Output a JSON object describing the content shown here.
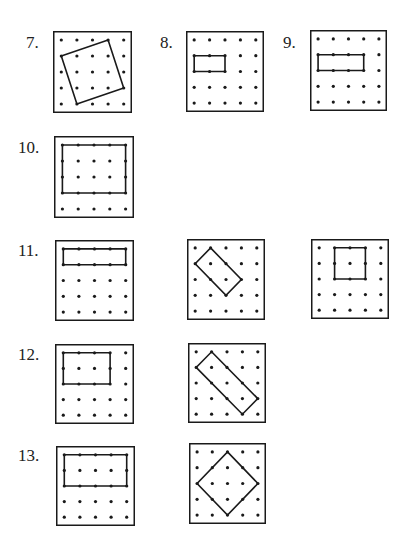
{
  "colors": {
    "ink": "#1a1a1a",
    "background": "#ffffff"
  },
  "grid": {
    "rows": 5,
    "cols": 5
  },
  "problems": [
    {
      "label": "7.",
      "label_pos": [
        26,
        34
      ]
    },
    {
      "label": "8.",
      "label_pos": [
        160,
        34
      ]
    },
    {
      "label": "9.",
      "label_pos": [
        283,
        34
      ]
    },
    {
      "label": "10.",
      "label_pos": [
        18,
        139
      ]
    },
    {
      "label": "11.",
      "label_pos": [
        18,
        242
      ]
    },
    {
      "label": "12.",
      "label_pos": [
        18,
        346
      ]
    },
    {
      "label": "13.",
      "label_pos": [
        18,
        447
      ]
    }
  ],
  "boards": [
    {
      "id": "7",
      "box": [
        53,
        31,
        79,
        82
      ],
      "shape": [
        [
          0,
          1
        ],
        [
          3,
          0
        ],
        [
          4,
          3
        ],
        [
          1,
          4
        ]
      ]
    },
    {
      "id": "8",
      "box": [
        186,
        31,
        78,
        81
      ],
      "shape": [
        [
          0,
          1
        ],
        [
          2,
          1
        ],
        [
          2,
          2
        ],
        [
          0,
          2
        ]
      ]
    },
    {
      "id": "9",
      "box": [
        310,
        30,
        77,
        81
      ],
      "shape": [
        [
          0,
          1
        ],
        [
          3,
          1
        ],
        [
          3,
          2
        ],
        [
          0,
          2
        ]
      ]
    },
    {
      "id": "10",
      "box": [
        54,
        136,
        80,
        82
      ],
      "shape": [
        [
          0,
          0
        ],
        [
          4,
          0
        ],
        [
          4,
          3
        ],
        [
          0,
          3
        ]
      ]
    },
    {
      "id": "11a",
      "box": [
        55,
        240,
        79,
        81
      ],
      "shape": [
        [
          0,
          0
        ],
        [
          4,
          0
        ],
        [
          4,
          1
        ],
        [
          0,
          1
        ]
      ]
    },
    {
      "id": "11b",
      "box": [
        187,
        239,
        78,
        81
      ],
      "shape": [
        [
          1,
          0
        ],
        [
          3,
          2
        ],
        [
          2,
          3
        ],
        [
          0,
          1
        ]
      ]
    },
    {
      "id": "11c",
      "box": [
        311,
        239,
        78,
        80
      ],
      "shape": [
        [
          1,
          0
        ],
        [
          3,
          0
        ],
        [
          3,
          2
        ],
        [
          1,
          2
        ]
      ]
    },
    {
      "id": "12a",
      "box": [
        55,
        344,
        79,
        80
      ],
      "shape": [
        [
          0,
          0
        ],
        [
          3,
          0
        ],
        [
          3,
          2
        ],
        [
          0,
          2
        ]
      ]
    },
    {
      "id": "12b",
      "box": [
        188,
        343,
        78,
        80
      ],
      "shape": [
        [
          1,
          0
        ],
        [
          4,
          3
        ],
        [
          3,
          4
        ],
        [
          0,
          1
        ]
      ]
    },
    {
      "id": "13a",
      "box": [
        56,
        446,
        79,
        80
      ],
      "shape": [
        [
          0,
          0
        ],
        [
          4,
          0
        ],
        [
          4,
          2
        ],
        [
          0,
          2
        ]
      ]
    },
    {
      "id": "13b",
      "box": [
        189,
        443,
        77,
        81
      ],
      "shape": [
        [
          2,
          0
        ],
        [
          4,
          2
        ],
        [
          2,
          4
        ],
        [
          0,
          2
        ]
      ]
    }
  ]
}
